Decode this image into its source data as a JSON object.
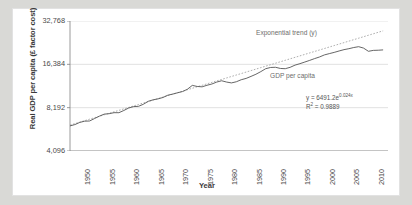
{
  "chart_data": {
    "type": "line",
    "title": "",
    "subtitle": "",
    "xlabel": "Year",
    "ylabel": "Real GDP per capita (£ factor cost)",
    "xlim": [
      1948,
      2013
    ],
    "ylim": [
      4096,
      32768
    ],
    "yscale": "log2",
    "grid": true,
    "grid_axis": "y",
    "legend_position": "inline-annotations",
    "y_ticks": [
      4096,
      8192,
      16384,
      32768
    ],
    "y_tick_labels": [
      "4,096",
      "8,192",
      "16,384",
      "32,768"
    ],
    "x_ticks": [
      1950,
      1955,
      1960,
      1965,
      1970,
      1975,
      1980,
      1985,
      1990,
      1995,
      2000,
      2005,
      2010
    ],
    "x_tick_labels": [
      "1950",
      "1955",
      "1960",
      "1965",
      "1970",
      "1975",
      "1980",
      "1985",
      "1990",
      "1995",
      "2000",
      "2005",
      "2010"
    ],
    "annotations": [
      {
        "name": "trend-label",
        "text": "Exponential trend (y)"
      },
      {
        "name": "series-label",
        "text": "GDP per capita"
      },
      {
        "name": "equation",
        "text": "y = 6491.2e",
        "exponent": "0.024x"
      },
      {
        "name": "r-squared",
        "text": "R",
        "superscript": "2",
        "value": " = 0.9889"
      }
    ],
    "series": [
      {
        "name": "GDP per capita",
        "style": "solid",
        "color": "#555555",
        "x": [
          1948,
          1949,
          1950,
          1951,
          1952,
          1953,
          1954,
          1955,
          1956,
          1957,
          1958,
          1959,
          1960,
          1961,
          1962,
          1963,
          1964,
          1965,
          1966,
          1967,
          1968,
          1969,
          1970,
          1971,
          1972,
          1973,
          1974,
          1975,
          1976,
          1977,
          1978,
          1979,
          1980,
          1981,
          1982,
          1983,
          1984,
          1985,
          1986,
          1987,
          1988,
          1989,
          1990,
          1991,
          1992,
          1993,
          1994,
          1995,
          1996,
          1997,
          1998,
          1999,
          2000,
          2001,
          2002,
          2003,
          2004,
          2005,
          2006,
          2007,
          2008,
          2009,
          2010,
          2011,
          2012
        ],
        "y": [
          6120,
          6250,
          6470,
          6600,
          6620,
          6880,
          7150,
          7390,
          7440,
          7560,
          7560,
          7830,
          8150,
          8330,
          8370,
          8650,
          9070,
          9290,
          9430,
          9640,
          10000,
          10180,
          10400,
          10600,
          11000,
          11700,
          11500,
          11430,
          11720,
          11960,
          12340,
          12600,
          12340,
          12170,
          12400,
          12810,
          13080,
          13510,
          13980,
          14580,
          15280,
          15580,
          15630,
          15340,
          15280,
          15620,
          16180,
          16560,
          17000,
          17460,
          17960,
          18430,
          19050,
          19440,
          19830,
          20290,
          20720,
          21040,
          21440,
          21730,
          21250,
          20180,
          20480,
          20530,
          20640
        ]
      },
      {
        "name": "Exponential trend (y)",
        "style": "dotted",
        "color": "#999999",
        "equation": "y = 6491.2e^(0.024x)",
        "r_squared": 0.9889,
        "x": [
          1948,
          2012
        ],
        "y": [
          6200,
          28000
        ]
      }
    ]
  }
}
